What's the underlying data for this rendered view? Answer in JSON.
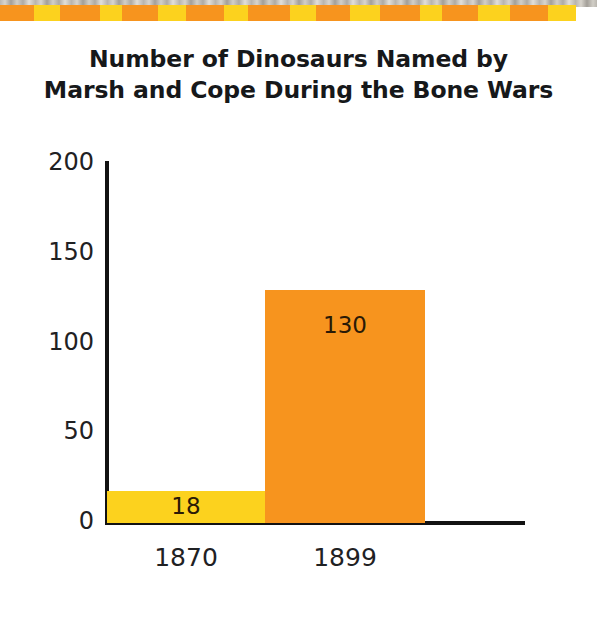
{
  "banner": {
    "name": "decorative-top-strip",
    "colors": [
      "#F7941E",
      "#FCD21E"
    ],
    "block_count": 18
  },
  "chart_data": {
    "type": "bar",
    "title": "Number of Dinosaurs Named by Marsh and Cope During the Bone Wars",
    "title_lines": [
      "Number of Dinosaurs Named by",
      "Marsh and Cope During the Bone Wars"
    ],
    "xlabel": "",
    "ylabel": "",
    "categories": [
      "1870",
      "1899"
    ],
    "values": [
      18,
      130
    ],
    "value_labels": [
      "18",
      "130"
    ],
    "bar_colors": [
      "#FCD21E",
      "#F7941E"
    ],
    "ylim": [
      0,
      200
    ],
    "yticks": [
      0,
      50,
      100,
      150,
      200
    ],
    "ytick_labels": [
      "0",
      "50",
      "100",
      "150",
      "200"
    ],
    "grid": false,
    "legend": false
  }
}
